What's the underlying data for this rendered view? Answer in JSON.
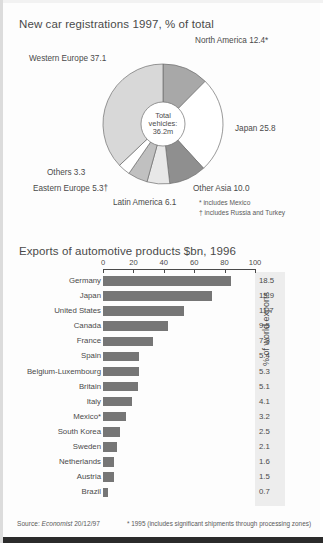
{
  "pie_chart": {
    "title": "New car registrations 1997, % of total",
    "hub": {
      "line1": "Total",
      "line2": "vehicles:",
      "line3": "36.2m"
    },
    "footnotes": [
      "* includes Mexico",
      "† includes Russia and Turkey"
    ]
  },
  "bar_chart": {
    "title": "Exports of automotive products $bn, 1996",
    "ylabel": "% of world exports",
    "footnote": "* 1995 (includes significant shipments through processing zones)",
    "source": "Source: ",
    "source_italic": "Economist",
    "source_date": " 20/12/97"
  },
  "chart_data": [
    {
      "type": "pie",
      "title": "New car registrations 1997, % of total",
      "unit": "% of total",
      "center_label": "Total vehicles: 36.2m",
      "total_vehicles": "36.2m",
      "legend_position": "outside-labels",
      "categories": [
        "North America 12.4*",
        "Japan 25.8",
        "Other Asia 10.0",
        "Latin America 6.1",
        "Eastern Europe 5.3†",
        "Others 3.3",
        "Western Europe 37.1"
      ],
      "slices": [
        {
          "label": "North America",
          "value": 12.4,
          "display": "North America 12.4*",
          "color": "#a8a8a8"
        },
        {
          "label": "Japan",
          "value": 25.8,
          "display": "Japan 25.8",
          "color": "#ffffff"
        },
        {
          "label": "Other Asia",
          "value": 10.0,
          "display": "Other Asia 10.0",
          "color": "#8f8f8f"
        },
        {
          "label": "Latin America",
          "value": 6.1,
          "display": "Latin America 6.1",
          "color": "#e8e8e8"
        },
        {
          "label": "Eastern Europe",
          "value": 5.3,
          "display": "Eastern Europe 5.3†",
          "color": "#c0c0c0"
        },
        {
          "label": "Others",
          "value": 3.3,
          "display": "Others 3.3",
          "color": "#ffffff"
        },
        {
          "label": "Western Europe",
          "value": 37.1,
          "display": "Western Europe 37.1",
          "color": "#d8d8d8"
        }
      ],
      "annotations": [
        "* includes Mexico",
        "† includes Russia and Turkey"
      ]
    },
    {
      "type": "bar",
      "orientation": "horizontal",
      "title": "Exports of automotive products $bn, 1996",
      "xlabel": "",
      "ylabel": "% of world exports",
      "xlim": [
        0,
        100
      ],
      "xticks": [
        0,
        20,
        40,
        60,
        80,
        100
      ],
      "grid": false,
      "bar_color": "#767676",
      "categories": [
        "Germany",
        "Japan",
        "United States",
        "Canada",
        "France",
        "Spain",
        "Belgium-Luxembourg",
        "Britain",
        "Italy",
        "Mexico*",
        "South Korea",
        "Sweden",
        "Netherlands",
        "Austria",
        "Brazil"
      ],
      "values": [
        18.5,
        15.9,
        11.7,
        9.5,
        7.3,
        5.4,
        5.3,
        5.1,
        4.1,
        3.2,
        2.5,
        2.1,
        1.6,
        1.5,
        0.7
      ],
      "bar_lengths_pct": [
        84,
        72,
        53,
        43,
        33,
        24,
        24,
        23,
        19,
        15,
        11,
        9,
        7,
        7,
        3
      ],
      "annotations": [
        "* 1995 (includes significant shipments through processing zones)"
      ],
      "source": "Source: Economist 20/12/97"
    }
  ]
}
